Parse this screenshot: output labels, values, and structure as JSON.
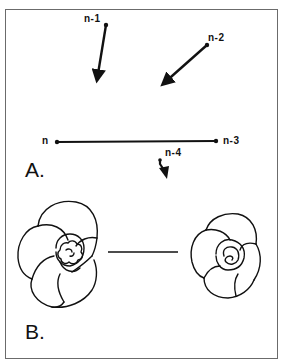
{
  "figure": {
    "panel_a": {
      "label": "A.",
      "nodes": {
        "n": "n",
        "n_minus_1": "n-1",
        "n_minus_2": "n-2",
        "n_minus_3": "n-3",
        "n_minus_4": "n-4"
      }
    },
    "panel_b": {
      "label": "B."
    },
    "colors": {
      "stroke": "#111111",
      "border": "#6b6b6b",
      "background": "#ffffff"
    }
  }
}
